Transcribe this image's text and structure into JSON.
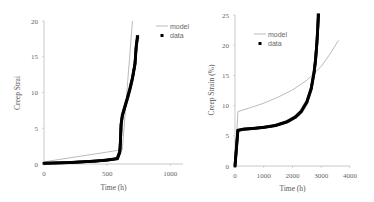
{
  "chart_data": [
    {
      "type": "line",
      "title": "",
      "xlabel": "Time (h)",
      "ylabel": "Creep Strai",
      "xlim": [
        0,
        1100
      ],
      "ylim": [
        0,
        20
      ],
      "xticks": [
        "0",
        "500",
        "1000"
      ],
      "yticks": [
        "0",
        "5",
        "10",
        "15",
        "20"
      ],
      "legend": [
        "model",
        "data"
      ],
      "legend_position": "top-right",
      "series": [
        {
          "name": "model",
          "style": "line",
          "x": [
            0,
            620,
            700
          ],
          "y": [
            0.3,
            2.0,
            20
          ]
        },
        {
          "name": "data",
          "style": "markers",
          "x": [
            0,
            100,
            200,
            300,
            400,
            500,
            580,
            600,
            605,
            610,
            620,
            640,
            660,
            680,
            700,
            720,
            730,
            740
          ],
          "y": [
            0.1,
            0.15,
            0.2,
            0.3,
            0.4,
            0.55,
            0.75,
            1.7,
            3.2,
            5.5,
            6.8,
            8.0,
            9.2,
            10.5,
            12.0,
            14.0,
            16.5,
            17.8
          ]
        }
      ]
    },
    {
      "type": "line",
      "title": "",
      "xlabel": "Time (h)",
      "ylabel": "Creep Strain (%)",
      "xlim": [
        0,
        4000
      ],
      "ylim": [
        0,
        25
      ],
      "xticks": [
        "0",
        "1000",
        "2000",
        "3000",
        "4000"
      ],
      "yticks": [
        "0",
        "5",
        "10",
        "15",
        "20",
        "25"
      ],
      "legend": [
        "model",
        "data"
      ],
      "legend_position": "upper-middle",
      "series": [
        {
          "name": "model",
          "style": "line",
          "x": [
            0,
            100,
            500,
            1000,
            1500,
            2000,
            2500,
            3000,
            3300,
            3600
          ],
          "y": [
            0,
            9.0,
            9.6,
            10.4,
            11.4,
            12.6,
            14.2,
            16.5,
            18.5,
            20.8
          ]
        },
        {
          "name": "data",
          "style": "markers",
          "x": [
            0,
            50,
            100,
            300,
            600,
            1000,
            1400,
            1800,
            2100,
            2300,
            2500,
            2650,
            2750,
            2800,
            2850,
            2880,
            2900
          ],
          "y": [
            0,
            3.0,
            5.9,
            6.1,
            6.2,
            6.4,
            6.7,
            7.3,
            8.1,
            9.0,
            10.6,
            12.8,
            15.5,
            17.5,
            20.5,
            23.0,
            25.0
          ]
        }
      ]
    }
  ]
}
